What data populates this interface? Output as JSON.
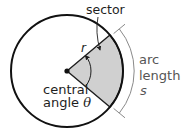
{
  "figure": {
    "labels": {
      "sector": "sector",
      "radius": "r",
      "central_line1": "central",
      "central_line2": "angle ",
      "theta": "θ",
      "arc_line1": "arc",
      "arc_line2": "length",
      "arc_symbol": "s"
    },
    "colors": {
      "circle_stroke": "#111111",
      "sector_fill": "#d0d0d0",
      "bracket_stroke": "#8a8a8a",
      "text_dark": "#1e1e1e",
      "text_gray": "#555555"
    }
  }
}
